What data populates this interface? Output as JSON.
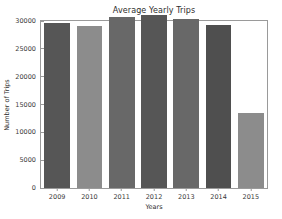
{
  "chart_data": {
    "type": "bar",
    "title": "Average Yearly Trips",
    "xlabel": "Years",
    "ylabel": "Number of Trips",
    "categories": [
      "2009",
      "2010",
      "2011",
      "2012",
      "2013",
      "2014",
      "2015"
    ],
    "values": [
      29600,
      29100,
      30700,
      31100,
      30400,
      29200,
      13550
    ],
    "bar_colors": [
      "#565656",
      "#8c8c8c",
      "#686868",
      "#565656",
      "#686868",
      "#4f4f4f",
      "#8c8c8c"
    ],
    "ylim": [
      0,
      30000
    ],
    "yticks": [
      0,
      5000,
      10000,
      15000,
      20000,
      25000,
      30000
    ],
    "ytick_labels": [
      "0",
      "5000",
      "10000",
      "15000",
      "20000",
      "25000",
      "30000"
    ],
    "grid": false,
    "legend": null,
    "axis_color": "#9a9a9a",
    "text_color": "#3a3a3a",
    "background": "#ffffff"
  }
}
